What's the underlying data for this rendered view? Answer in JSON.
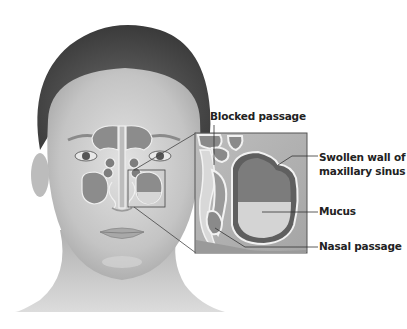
{
  "figure": {
    "labels": {
      "blocked_passage": "Blocked passage",
      "swollen_wall_line1": "Swollen wall of",
      "swollen_wall_line2": "maxillary sinus",
      "mucus": "Mucus",
      "nasal_passage": "Nasal passage"
    },
    "colors": {
      "skin_light": "#d9d9d9",
      "skin_mid": "#b8b8b8",
      "hair": "#4a4a4a",
      "sinus_fill": "#8c8c8c",
      "mucus_fill": "#d6d6d6",
      "outline_white": "#f2f2f2",
      "leader_line": "#333333"
    }
  }
}
